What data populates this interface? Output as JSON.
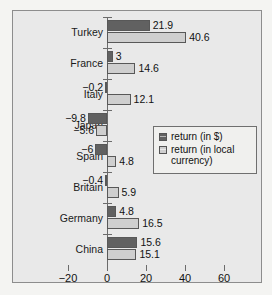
{
  "chart_data": {
    "type": "bar",
    "orientation": "horizontal",
    "title": "",
    "xlabel": "",
    "ylabel": "",
    "xlim": [
      -20,
      60
    ],
    "xticks": [
      -20,
      0,
      20,
      40,
      60
    ],
    "xtick_labels": [
      "−20",
      "0",
      "20",
      "40",
      "60"
    ],
    "grid": false,
    "legend_position": "middle-right-inside",
    "categories": [
      "Turkey",
      "France",
      "Italy",
      "Japan",
      "Spain",
      "Britain",
      "Germany",
      "China"
    ],
    "series": [
      {
        "name": "return (in $)",
        "color": "#616161",
        "values": [
          21.9,
          3,
          -0.2,
          -9.8,
          -6,
          -0.4,
          4.8,
          15.6
        ],
        "labels": [
          "21.9",
          "3",
          "−0.2",
          "−9.8",
          "−6",
          "−0.4",
          "4.8",
          "15.6"
        ]
      },
      {
        "name": "return (in local currency)",
        "color": "#cfcfcf",
        "values": [
          40.6,
          14.6,
          12.1,
          -5.6,
          4.8,
          5.9,
          16.5,
          15.1
        ],
        "labels": [
          "40.6",
          "14.6",
          "12.1",
          "−5.6",
          "4.8",
          "5.9",
          "16.5",
          "15.1"
        ]
      }
    ],
    "legend": [
      "return (in $)",
      "return (in local currency)"
    ],
    "legend_lines": [
      [
        "return (in $)"
      ],
      [
        "return (in local",
        "currency)"
      ]
    ]
  },
  "colors": {
    "background": "#e9e9e9",
    "page_background": "#f4f4f2",
    "frame_border": "#8d8d8d",
    "axis": "#6b6b6b",
    "series_dollar": "#616161",
    "series_local": "#cfcfcf",
    "text": "#111111"
  }
}
